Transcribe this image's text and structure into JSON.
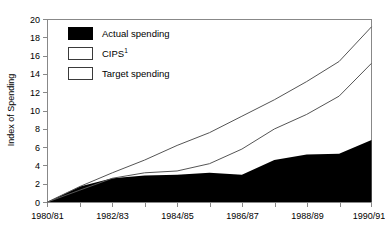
{
  "chart_data": {
    "type": "area",
    "title": "",
    "subtitle": "",
    "xlabel": "",
    "ylabel": "Index of Spending",
    "xlim": [
      0,
      10
    ],
    "ylim": [
      0,
      20
    ],
    "ytick_step": 2,
    "grid": false,
    "legend_position": "upper-left",
    "x_tick_labels": [
      "1980/81",
      "",
      "1982/83",
      "",
      "1984/85",
      "",
      "1986/87",
      "",
      "1988/89",
      "",
      "1990/91"
    ],
    "x_major_labels": [
      "1980/81",
      "1982/83",
      "1984/85",
      "1986/87",
      "1988/89",
      "1990/91"
    ],
    "y_tick_labels": [
      "0",
      "2",
      "4",
      "6",
      "8",
      "10",
      "12",
      "14",
      "16",
      "18",
      "20"
    ],
    "x": [
      "1980/81",
      "1981/82",
      "1982/83",
      "1983/84",
      "1984/85",
      "1985/86",
      "1986/87",
      "1987/88",
      "1988/89",
      "1989/90",
      "1990/91"
    ],
    "series": [
      {
        "name": "Actual spending",
        "style": "filled-area",
        "color": "#000000",
        "values": [
          0.0,
          1.7,
          2.6,
          2.9,
          3.0,
          3.2,
          3.0,
          4.6,
          5.2,
          5.3,
          6.8
        ],
        "note": "area drops vertically to 0 at the right edge"
      },
      {
        "name": "CIPS",
        "footnote_marker": "1",
        "style": "line",
        "color": "#555555",
        "values": [
          0.0,
          1.3,
          2.6,
          3.2,
          3.4,
          4.2,
          5.8,
          8.0,
          9.6,
          11.6,
          15.2
        ]
      },
      {
        "name": "Target spending",
        "style": "line",
        "color": "#555555",
        "values": [
          0.0,
          1.7,
          3.2,
          4.6,
          6.2,
          7.6,
          9.4,
          11.2,
          13.2,
          15.4,
          19.2
        ]
      }
    ]
  },
  "legend": {
    "items": [
      {
        "label": "Actual spending",
        "swatch": "filled",
        "footnote": ""
      },
      {
        "label": "CIPS",
        "swatch": "hollow",
        "footnote": "1"
      },
      {
        "label": "Target spending",
        "swatch": "hollow",
        "footnote": ""
      }
    ]
  },
  "axes": {
    "y_title": "Index of Spending"
  }
}
